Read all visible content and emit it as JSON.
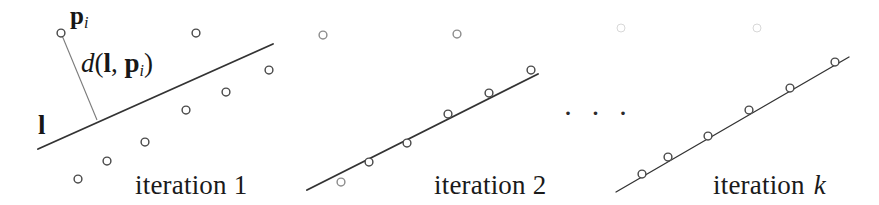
{
  "figure": {
    "caption_panel1": "iteration 1",
    "caption_panel2": "iteration 2",
    "caption_panel3_prefix": "iteration ",
    "caption_panel3_index": "k",
    "ellipsis": "· · ·",
    "labels": {
      "point_label": "p",
      "point_label_sub": "i",
      "distance_d": "d",
      "distance_open": "(",
      "distance_line": "l",
      "distance_comma": ", ",
      "distance_point": "p",
      "distance_point_sub": "i",
      "distance_close": ")",
      "line_label": "l"
    },
    "colors": {
      "ink": "#1a1a1a",
      "line": "#333333",
      "point_stroke": "#4a4a4a",
      "faint_point_stroke": "#d8d8d8",
      "background": "#ffffff"
    }
  },
  "chart_data": {
    "type": "scatter",
    "xlabel": "",
    "ylabel": "",
    "grid": false,
    "legend": false,
    "panels": [
      {
        "name": "iteration 1",
        "caption": "iteration 1",
        "fit_line": {
          "x1": 38,
          "y1": 149,
          "x2": 273,
          "y2": 44
        },
        "points": [
          {
            "x": 61,
            "y": 33,
            "label": "p_i"
          },
          {
            "x": 196,
            "y": 33
          },
          {
            "x": 269,
            "y": 70
          },
          {
            "x": 226,
            "y": 92
          },
          {
            "x": 186,
            "y": 110
          },
          {
            "x": 145,
            "y": 142
          },
          {
            "x": 107,
            "y": 161
          },
          {
            "x": 78,
            "y": 179
          }
        ],
        "annotations": [
          {
            "type": "distance-segment",
            "text": "d(l, p_i)",
            "from": {
              "x": 61,
              "y": 33
            },
            "to": {
              "x": 97,
              "y": 120
            }
          },
          {
            "type": "line-label",
            "text": "l",
            "x": 43,
            "y": 128
          },
          {
            "type": "point-label",
            "text": "p_i",
            "x": 74,
            "y": 18
          }
        ]
      },
      {
        "name": "iteration 2",
        "caption": "iteration 2",
        "fit_line": {
          "x1": 307,
          "y1": 190,
          "x2": 538,
          "y2": 74
        },
        "points": [
          {
            "x": 323,
            "y": 35,
            "faint": true
          },
          {
            "x": 457,
            "y": 34,
            "faint": true
          },
          {
            "x": 531,
            "y": 70
          },
          {
            "x": 489,
            "y": 93
          },
          {
            "x": 448,
            "y": 114
          },
          {
            "x": 407,
            "y": 143
          },
          {
            "x": 369,
            "y": 162
          },
          {
            "x": 341,
            "y": 182,
            "faint": true
          }
        ],
        "annotations": []
      },
      {
        "name": "iteration k",
        "caption": "iteration k",
        "fit_line": {
          "x1": 616,
          "y1": 192,
          "x2": 849,
          "y2": 57
        },
        "points": [
          {
            "x": 621,
            "y": 28,
            "faint": true,
            "ghost": true
          },
          {
            "x": 757,
            "y": 28,
            "faint": true,
            "ghost": true
          },
          {
            "x": 835,
            "y": 62
          },
          {
            "x": 790,
            "y": 88
          },
          {
            "x": 749,
            "y": 110
          },
          {
            "x": 708,
            "y": 136
          },
          {
            "x": 668,
            "y": 157
          },
          {
            "x": 642,
            "y": 174
          }
        ],
        "annotations": []
      }
    ],
    "ellipsis_between_panels": {
      "x": 566,
      "y": 110,
      "text": "· · ·"
    }
  }
}
